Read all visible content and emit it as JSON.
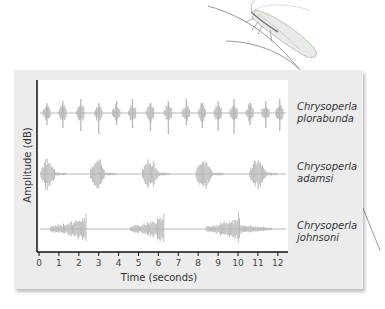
{
  "chart_data": {
    "type": "line",
    "title": "",
    "xlabel": "Time (seconds)",
    "ylabel": "Amplitude (dB)",
    "xlim": [
      0,
      12.5
    ],
    "x_ticks": [
      "0",
      "1",
      "2",
      "3",
      "4",
      "5",
      "6",
      "7",
      "8",
      "9",
      "10",
      "11",
      "12"
    ],
    "grid": false,
    "series": [
      {
        "name": "Chrysoperla plorabunda",
        "name_line1": "Chrysoperla",
        "name_line2": "plorabunda",
        "pattern": "short regular pulses",
        "pulse_times_s": [
          0.4,
          1.2,
          2.1,
          3.0,
          3.9,
          4.7,
          5.6,
          6.5,
          7.4,
          8.2,
          9.0,
          9.8,
          10.6,
          11.4,
          12.1
        ]
      },
      {
        "name": "Chrysoperla adamsi",
        "name_line1": "Chrysoperla",
        "name_line2": "adamsi",
        "pattern": "medium bursts",
        "burst_starts_s": [
          0.1,
          2.6,
          5.2,
          7.9,
          10.6
        ],
        "burst_durations_s": [
          1.3,
          1.3,
          1.4,
          1.4,
          1.4
        ]
      },
      {
        "name": "Chrysoperla johnsoni",
        "name_line1": "Chrysoperla",
        "name_line2": "johnsoni",
        "pattern": "long crescendo bursts",
        "burst_starts_s": [
          0.6,
          4.6,
          8.4
        ],
        "burst_durations_s": [
          1.8,
          1.7,
          3.3
        ]
      }
    ]
  },
  "colors": {
    "waveform": "#b8b8b8",
    "panel": "#ececec",
    "axis": "#111111"
  }
}
